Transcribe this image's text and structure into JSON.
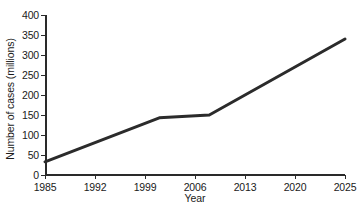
{
  "chart_data": {
    "type": "line",
    "title": "",
    "xlabel": "Year",
    "ylabel": "Number of cases (millions)",
    "xlim": [
      1985,
      2025
    ],
    "ylim": [
      0,
      400
    ],
    "grid": false,
    "legend": "none",
    "line_color": "#2b2b2b",
    "line_width_px": 3,
    "background_color": "#ffffff",
    "axis_color": "#2a2a2a",
    "x_ticks": [
      1985,
      1992,
      1999,
      2006,
      2013,
      2020,
      2025
    ],
    "x_tick_labels": [
      "1985",
      "1992",
      "1999",
      "2006",
      "2013",
      "2020",
      "2025"
    ],
    "x_tick_spacing": "even",
    "y_ticks": [
      0,
      50,
      100,
      150,
      200,
      250,
      300,
      350,
      400
    ],
    "y_tick_labels": [
      "0",
      "50",
      "100",
      "150",
      "200",
      "250",
      "300",
      "350",
      "400"
    ],
    "series": [
      {
        "name": "Number of cases",
        "x": [
          1985,
          2001,
          2008,
          2025
        ],
        "values": [
          33,
          143,
          150,
          340
        ]
      }
    ],
    "annotations": []
  }
}
